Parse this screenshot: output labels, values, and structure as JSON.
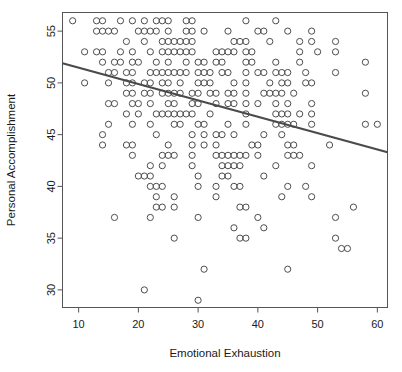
{
  "chart_data": {
    "type": "scatter",
    "title": "",
    "xlabel": "Emotional Exhaustion",
    "ylabel": "Personal Accomplishment",
    "xlim": [
      7.3,
      61.7
    ],
    "ylim": [
      28.3,
      56.8
    ],
    "xticks": [
      10,
      20,
      30,
      40,
      50,
      60
    ],
    "yticks": [
      30,
      35,
      40,
      45,
      50,
      55
    ],
    "xtick_labels": [
      "10",
      "20",
      "30",
      "40",
      "50",
      "60"
    ],
    "ytick_labels": [
      "30",
      "35",
      "40",
      "45",
      "50",
      "55"
    ],
    "grid": false,
    "legend": false,
    "marker": "open-circle",
    "marker_color": "#4d4d4d",
    "marker_radius_px": 3.1,
    "frame": true,
    "frame_color": "#555555",
    "trendline": {
      "type": "linear-regression",
      "color": "#4a4a4a",
      "width_px": 2.2,
      "x_start": 7.3,
      "y_start": 51.9,
      "x_end": 61.7,
      "y_end": 43.3,
      "slope": -0.158,
      "intercept": 53.05
    },
    "points": [
      [
        9,
        56
      ],
      [
        13,
        56
      ],
      [
        14,
        56
      ],
      [
        17,
        56
      ],
      [
        19,
        56
      ],
      [
        21,
        56
      ],
      [
        23,
        56
      ],
      [
        24,
        56
      ],
      [
        25,
        56
      ],
      [
        28,
        56
      ],
      [
        29,
        56
      ],
      [
        38,
        56
      ],
      [
        43,
        56
      ],
      [
        13,
        55
      ],
      [
        14,
        55
      ],
      [
        15,
        55
      ],
      [
        16,
        55
      ],
      [
        20,
        55
      ],
      [
        21,
        55
      ],
      [
        22,
        55
      ],
      [
        23,
        55
      ],
      [
        25,
        55
      ],
      [
        28,
        55
      ],
      [
        29,
        55
      ],
      [
        31,
        55
      ],
      [
        35,
        55
      ],
      [
        40,
        55
      ],
      [
        41,
        55
      ],
      [
        45,
        55
      ],
      [
        49,
        55
      ],
      [
        18,
        54
      ],
      [
        21,
        54
      ],
      [
        24,
        54
      ],
      [
        25,
        54
      ],
      [
        26,
        54
      ],
      [
        27,
        54
      ],
      [
        28,
        54
      ],
      [
        29,
        54
      ],
      [
        36,
        54
      ],
      [
        37,
        54
      ],
      [
        38,
        54
      ],
      [
        42,
        54
      ],
      [
        47,
        54
      ],
      [
        49,
        54
      ],
      [
        53,
        54
      ],
      [
        11,
        53
      ],
      [
        13,
        53
      ],
      [
        14,
        53
      ],
      [
        17,
        53
      ],
      [
        19,
        53
      ],
      [
        22,
        53
      ],
      [
        24,
        53
      ],
      [
        25,
        53
      ],
      [
        26,
        53
      ],
      [
        27,
        53
      ],
      [
        28,
        53
      ],
      [
        29,
        53
      ],
      [
        33,
        53
      ],
      [
        34,
        53
      ],
      [
        35,
        53
      ],
      [
        36,
        53
      ],
      [
        38,
        53
      ],
      [
        39,
        53
      ],
      [
        47,
        53
      ],
      [
        50,
        53
      ],
      [
        53,
        53
      ],
      [
        14,
        52
      ],
      [
        16,
        52
      ],
      [
        17,
        52
      ],
      [
        19,
        52
      ],
      [
        20,
        52
      ],
      [
        23,
        52
      ],
      [
        25,
        52
      ],
      [
        28,
        52
      ],
      [
        30,
        52
      ],
      [
        31,
        52
      ],
      [
        33,
        52
      ],
      [
        34,
        52
      ],
      [
        38,
        52
      ],
      [
        39,
        52
      ],
      [
        43,
        52
      ],
      [
        47,
        52
      ],
      [
        58,
        52
      ],
      [
        15,
        51
      ],
      [
        16,
        51
      ],
      [
        18,
        51
      ],
      [
        19,
        51
      ],
      [
        22,
        51
      ],
      [
        23,
        51
      ],
      [
        24,
        51
      ],
      [
        25,
        51
      ],
      [
        26,
        51
      ],
      [
        27,
        51
      ],
      [
        28,
        51
      ],
      [
        30,
        51
      ],
      [
        31,
        51
      ],
      [
        32,
        51
      ],
      [
        34,
        51
      ],
      [
        35,
        51
      ],
      [
        38,
        51
      ],
      [
        40,
        51
      ],
      [
        41,
        51
      ],
      [
        43,
        51
      ],
      [
        44,
        51
      ],
      [
        45,
        51
      ],
      [
        48,
        51
      ],
      [
        53,
        51
      ],
      [
        11,
        50
      ],
      [
        15,
        50
      ],
      [
        18,
        50
      ],
      [
        19,
        50
      ],
      [
        21,
        50
      ],
      [
        22,
        50
      ],
      [
        24,
        50
      ],
      [
        25,
        50
      ],
      [
        27,
        50
      ],
      [
        30,
        50
      ],
      [
        31,
        50
      ],
      [
        32,
        50
      ],
      [
        36,
        50
      ],
      [
        38,
        50
      ],
      [
        42,
        50
      ],
      [
        44,
        50
      ],
      [
        45,
        50
      ],
      [
        48,
        50
      ],
      [
        49,
        50
      ],
      [
        18,
        49
      ],
      [
        19,
        49
      ],
      [
        21,
        49
      ],
      [
        22,
        49
      ],
      [
        24,
        49
      ],
      [
        25,
        49
      ],
      [
        26,
        49
      ],
      [
        27,
        49
      ],
      [
        29,
        49
      ],
      [
        30,
        49
      ],
      [
        32,
        49
      ],
      [
        33,
        49
      ],
      [
        35,
        49
      ],
      [
        36,
        49
      ],
      [
        38,
        49
      ],
      [
        41,
        49
      ],
      [
        42,
        49
      ],
      [
        43,
        49
      ],
      [
        44,
        49
      ],
      [
        46,
        49
      ],
      [
        58,
        49
      ],
      [
        15,
        48
      ],
      [
        16,
        48
      ],
      [
        19,
        48
      ],
      [
        20,
        48
      ],
      [
        22,
        48
      ],
      [
        25,
        48
      ],
      [
        26,
        48
      ],
      [
        29,
        48
      ],
      [
        30,
        48
      ],
      [
        33,
        48
      ],
      [
        35,
        48
      ],
      [
        36,
        48
      ],
      [
        38,
        48
      ],
      [
        40,
        48
      ],
      [
        43,
        48
      ],
      [
        45,
        48
      ],
      [
        49,
        48
      ],
      [
        18,
        47
      ],
      [
        20,
        47
      ],
      [
        23,
        47
      ],
      [
        24,
        47
      ],
      [
        25,
        47
      ],
      [
        26,
        47
      ],
      [
        27,
        47
      ],
      [
        28,
        47
      ],
      [
        29,
        47
      ],
      [
        32,
        47
      ],
      [
        38,
        47
      ],
      [
        43,
        47
      ],
      [
        44,
        47
      ],
      [
        45,
        47
      ],
      [
        47,
        47
      ],
      [
        49,
        47
      ],
      [
        15,
        46
      ],
      [
        19,
        46
      ],
      [
        22,
        46
      ],
      [
        26,
        46
      ],
      [
        27,
        46
      ],
      [
        30,
        46
      ],
      [
        31,
        46
      ],
      [
        35,
        46
      ],
      [
        38,
        46
      ],
      [
        43,
        46
      ],
      [
        44,
        46
      ],
      [
        45,
        46
      ],
      [
        46,
        46
      ],
      [
        49,
        46
      ],
      [
        58,
        46
      ],
      [
        60,
        46
      ],
      [
        14,
        45
      ],
      [
        23,
        45
      ],
      [
        29,
        45
      ],
      [
        31,
        45
      ],
      [
        33,
        45
      ],
      [
        34,
        45
      ],
      [
        36,
        45
      ],
      [
        41,
        45
      ],
      [
        44,
        45
      ],
      [
        14,
        44
      ],
      [
        18,
        44
      ],
      [
        19,
        44
      ],
      [
        25,
        44
      ],
      [
        29,
        44
      ],
      [
        31,
        44
      ],
      [
        33,
        44
      ],
      [
        39,
        44
      ],
      [
        40,
        44
      ],
      [
        45,
        44
      ],
      [
        46,
        44
      ],
      [
        52,
        44
      ],
      [
        19,
        43
      ],
      [
        24,
        43
      ],
      [
        25,
        43
      ],
      [
        26,
        43
      ],
      [
        29,
        43
      ],
      [
        33,
        43
      ],
      [
        34,
        43
      ],
      [
        35,
        43
      ],
      [
        36,
        43
      ],
      [
        37,
        43
      ],
      [
        38,
        43
      ],
      [
        40,
        43
      ],
      [
        45,
        43
      ],
      [
        46,
        43
      ],
      [
        47,
        43
      ],
      [
        22,
        42
      ],
      [
        24,
        42
      ],
      [
        29,
        42
      ],
      [
        34,
        42
      ],
      [
        35,
        42
      ],
      [
        36,
        42
      ],
      [
        37,
        42
      ],
      [
        43,
        42
      ],
      [
        49,
        42
      ],
      [
        20,
        41
      ],
      [
        21,
        41
      ],
      [
        22,
        41
      ],
      [
        30,
        41
      ],
      [
        34,
        41
      ],
      [
        35,
        41
      ],
      [
        41,
        41
      ],
      [
        22,
        40
      ],
      [
        23,
        40
      ],
      [
        24,
        40
      ],
      [
        30,
        40
      ],
      [
        33,
        40
      ],
      [
        36,
        40
      ],
      [
        37,
        40
      ],
      [
        45,
        40
      ],
      [
        48,
        40
      ],
      [
        23,
        39
      ],
      [
        26,
        39
      ],
      [
        33,
        39
      ],
      [
        44,
        39
      ],
      [
        49,
        39
      ],
      [
        23,
        38
      ],
      [
        24,
        38
      ],
      [
        26,
        38
      ],
      [
        37,
        38
      ],
      [
        38,
        38
      ],
      [
        56,
        38
      ],
      [
        16,
        37
      ],
      [
        22,
        37
      ],
      [
        30,
        37
      ],
      [
        40,
        37
      ],
      [
        53,
        37
      ],
      [
        36,
        36
      ],
      [
        41,
        36
      ],
      [
        26,
        35
      ],
      [
        37,
        35
      ],
      [
        38,
        35
      ],
      [
        53,
        35
      ],
      [
        54,
        34
      ],
      [
        55,
        34
      ],
      [
        31,
        32
      ],
      [
        45,
        32
      ],
      [
        21,
        30
      ],
      [
        30,
        29
      ]
    ]
  },
  "axes": {
    "x_title": "Emotional Exhaustion",
    "y_title": "Personal Accomplishment"
  }
}
